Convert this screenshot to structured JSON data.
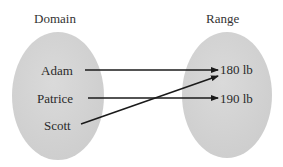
{
  "diagram": {
    "type": "mapping",
    "domain": {
      "title": "Domain",
      "items": [
        "Adam",
        "Patrice",
        "Scott"
      ]
    },
    "range": {
      "title": "Range",
      "items": [
        "180 lb",
        "190 lb"
      ]
    },
    "mappings": [
      {
        "from": "Adam",
        "to": "180 lb"
      },
      {
        "from": "Patrice",
        "to": "190 lb"
      },
      {
        "from": "Scott",
        "to": "180 lb"
      }
    ],
    "colors": {
      "ellipse_fill": "#d4d4d4",
      "arrow": "#1a1a1a",
      "text": "#2a2a2a"
    }
  }
}
